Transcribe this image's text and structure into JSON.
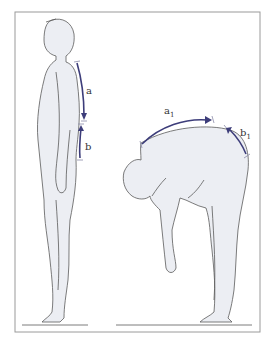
{
  "diagram": {
    "colors": {
      "figure_fill": "#eceef3",
      "outline": "#5a5a5a",
      "arrow": "#3d3d7a",
      "frame": "#9a9a9a"
    },
    "figures": [
      {
        "id": "standing",
        "labels": [
          "a",
          "b"
        ]
      },
      {
        "id": "bending",
        "labels": [
          "a",
          "b"
        ],
        "subscript": "1"
      }
    ]
  }
}
